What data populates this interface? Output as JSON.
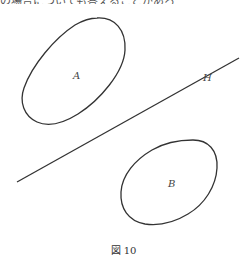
{
  "figure": {
    "caption": "図 10",
    "top_text_partial": "の場合についても答えることがあろ",
    "labels": {
      "region_a": "A",
      "region_b": "B",
      "line_h": "H"
    },
    "colors": {
      "stroke": "#333333",
      "background": "#ffffff"
    }
  }
}
